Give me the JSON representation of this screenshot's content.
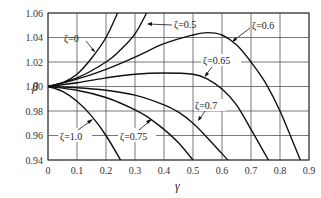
{
  "chart_data": {
    "type": "line",
    "title": "",
    "xlabel": "γ",
    "ylabel": "β",
    "xlim": [
      0,
      0.9
    ],
    "ylim": [
      0.94,
      1.06
    ],
    "grid": true,
    "x_ticks": [
      "0",
      "0.1",
      "0.2",
      "0.3",
      "0.4",
      "0.5",
      "0.6",
      "0.7",
      "0.8",
      "0.9"
    ],
    "y_ticks": [
      "0.94",
      "0.96",
      "0.98",
      "1.00",
      "1.02",
      "1.04",
      "1.06"
    ],
    "series": [
      {
        "name": "ζ=0",
        "x": [
          0,
          0.05,
          0.1,
          0.15,
          0.2,
          0.24
        ],
        "y": [
          1.0,
          1.003,
          1.01,
          1.023,
          1.04,
          1.06
        ]
      },
      {
        "name": "ζ=0.5",
        "x": [
          0,
          0.1,
          0.2,
          0.25,
          0.3,
          0.34
        ],
        "y": [
          1.0,
          1.007,
          1.02,
          1.03,
          1.043,
          1.06
        ]
      },
      {
        "name": "ζ=0.6",
        "x": [
          0,
          0.1,
          0.2,
          0.3,
          0.4,
          0.5,
          0.55,
          0.6,
          0.65,
          0.7,
          0.75,
          0.8,
          0.87
        ],
        "y": [
          1.0,
          1.006,
          1.014,
          1.024,
          1.035,
          1.042,
          1.044,
          1.042,
          1.034,
          1.02,
          1.003,
          0.98,
          0.94
        ]
      },
      {
        "name": "ζ=0.65",
        "x": [
          0,
          0.1,
          0.2,
          0.3,
          0.4,
          0.5,
          0.55,
          0.6,
          0.65,
          0.7,
          0.76
        ],
        "y": [
          1.0,
          1.003,
          1.007,
          1.01,
          1.011,
          1.01,
          1.006,
          0.998,
          0.985,
          0.965,
          0.94
        ]
      },
      {
        "name": "ζ=0.7",
        "x": [
          0,
          0.1,
          0.2,
          0.3,
          0.4,
          0.45,
          0.5,
          0.55,
          0.62
        ],
        "y": [
          1.0,
          0.999,
          0.997,
          0.993,
          0.985,
          0.979,
          0.97,
          0.958,
          0.94
        ]
      },
      {
        "name": "ζ=0.75",
        "x": [
          0,
          0.1,
          0.2,
          0.3,
          0.35,
          0.4,
          0.45,
          0.5
        ],
        "y": [
          1.0,
          0.997,
          0.991,
          0.981,
          0.974,
          0.965,
          0.954,
          0.94
        ]
      },
      {
        "name": "ζ=1.0",
        "x": [
          0,
          0.05,
          0.1,
          0.15,
          0.2,
          0.25
        ],
        "y": [
          1.0,
          0.996,
          0.988,
          0.976,
          0.96,
          0.94
        ]
      }
    ],
    "annotations": [
      {
        "text": "ζ=0",
        "x": 0.11,
        "y": 1.04
      },
      {
        "text": "ζ=0.5",
        "x": 0.47,
        "y": 1.055
      },
      {
        "text": "ζ=0.6",
        "x": 0.68,
        "y": 1.052
      },
      {
        "text": "ζ=0.65",
        "x": 0.52,
        "y": 1.02
      },
      {
        "text": "ζ=0.7",
        "x": 0.59,
        "y": 0.977
      },
      {
        "text": "ζ=0.75",
        "x": 0.37,
        "y": 0.955
      },
      {
        "text": "ζ=1.0",
        "x": 0.04,
        "y": 0.955
      }
    ]
  },
  "axes": {
    "x_title": "γ",
    "y_title": "β"
  },
  "labels": {
    "z0": "ζ=0",
    "z05": "ζ=0.5",
    "z06": "ζ=0.6",
    "z065": "ζ=0.65",
    "z07": "ζ=0.7",
    "z075": "ζ=0.75",
    "z10": "ζ=1.0"
  }
}
